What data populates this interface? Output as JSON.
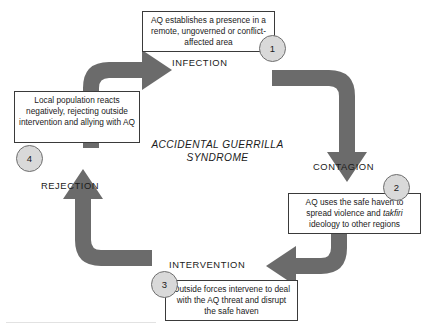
{
  "diagram": {
    "title": "ACCIDENTAL GUERRILLA SYNDROME",
    "title_line1": "ACCIDENTAL GUERRILLA",
    "title_line2": "SYNDROME",
    "arrow_color": "#6b6b6b",
    "circle_fill": "#d9d9d9",
    "box_border": "#3a3a3a",
    "stages": [
      {
        "number": "1",
        "label": "INFECTION",
        "text_prefix": "AQ establishes a presence in a remote, ungoverned or conflict-affected area",
        "text_italic": "",
        "text_suffix": ""
      },
      {
        "number": "2",
        "label": "CONTAGION",
        "text_prefix": "AQ uses the safe haven to spread violence and ",
        "text_italic": "takfiri",
        "text_suffix": " ideology to other regions"
      },
      {
        "number": "3",
        "label": "INTERVENTION",
        "text_prefix": "Outside forces intervene to deal with the AQ threat and disrupt the safe haven",
        "text_italic": "",
        "text_suffix": ""
      },
      {
        "number": "4",
        "label": "REJECTION",
        "text_prefix": "Local population reacts negatively, rejecting outside intervention and allying with AQ",
        "text_italic": "",
        "text_suffix": ""
      }
    ]
  }
}
